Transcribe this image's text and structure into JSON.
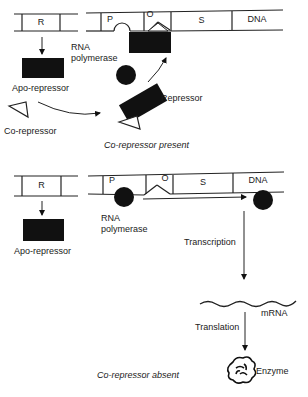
{
  "top_panel": {
    "caption": "Co-repressor present",
    "regulator_gene": "R",
    "segments": {
      "promoter": "P",
      "operator": "O",
      "structural": "S",
      "dna": "DNA"
    },
    "labels": {
      "rna_polymerase_line1": "RNA",
      "rna_polymerase_line2": "polymerase",
      "apo_repressor": "Apo-repressor",
      "co_repressor": "Co-repressor",
      "repressor": "Repressor"
    }
  },
  "bottom_panel": {
    "caption": "Co-repressor absent",
    "regulator_gene": "R",
    "segments": {
      "promoter": "P",
      "operator": "O",
      "structural": "S",
      "dna": "DNA"
    },
    "labels": {
      "rna_polymerase_line1": "RNA",
      "rna_polymerase_line2": "polymerase",
      "apo_repressor": "Apo-repressor",
      "transcription": "Transcription",
      "mrna": "mRNA",
      "translation": "Translation",
      "enzyme": "Enzyme"
    }
  }
}
